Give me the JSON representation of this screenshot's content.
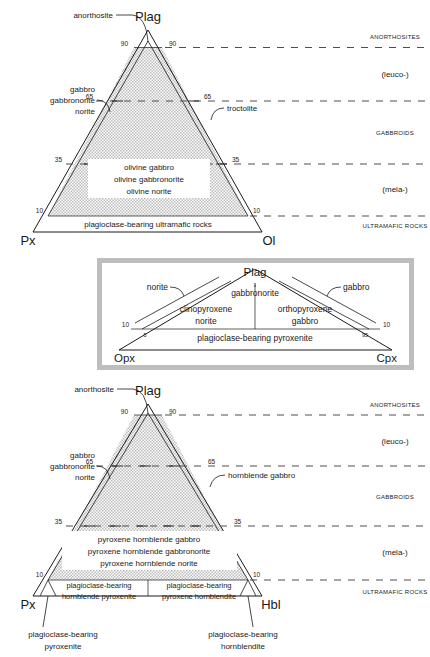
{
  "figure": {
    "kind": "ternary-classification-diagrams",
    "shade_color": "#d4d4d4",
    "dash_color": "#4e4e4e",
    "line_color": "#1a1a1a"
  },
  "top_diagram": {
    "name": "plag-px-ol-ternary",
    "apexes": {
      "top": "Plag",
      "left": "Px",
      "right": "Ol"
    },
    "ticks": {
      "left_90": "90",
      "right_90": "90",
      "left_65": "65",
      "right_65": "65",
      "left_35": "35",
      "right_35": "35",
      "left_10": "10",
      "right_10": "10"
    },
    "callouts": {
      "anorthosite": "anorthosite",
      "left_group_line1": "gabbro",
      "left_group_line2": "gabbronorite",
      "left_group_line3": "norite",
      "troctolite": "troctolite"
    },
    "center_box": {
      "line1": "olivine gabbro",
      "line2": "olivine gabbronorite",
      "line3": "olivine norite"
    },
    "base_band": "plagioclase-bearing ultramafic rocks",
    "side_categories": [
      "ANORTHOSITES",
      "(leuco-)",
      "GABBROIDS",
      "(mela-)",
      "ULTRAMAFIC ROCKS"
    ]
  },
  "inset_diagram": {
    "name": "plag-opx-cpx-ternary",
    "apexes": {
      "top": "Plag",
      "left": "Opx",
      "right": "Cpx"
    },
    "ticks": {
      "left_10": "10",
      "left_5": "5",
      "right_95": "95",
      "right_10": "10"
    },
    "callouts": {
      "norite": "norite",
      "gabbro": "gabbro",
      "gabbronorite": "gabbronorite"
    },
    "fields": {
      "left_line1": "clinopyroxene",
      "left_line2": "norite",
      "right_line1": "orthopyroxene",
      "right_line2": "gabbro"
    },
    "base_band": "plagioclase-bearing pyroxenite"
  },
  "bottom_diagram": {
    "name": "plag-px-hbl-ternary",
    "apexes": {
      "top": "Plag",
      "left": "Px",
      "right": "Hbl"
    },
    "ticks": {
      "left_90": "90",
      "right_90": "90",
      "left_65": "65",
      "right_65": "65",
      "left_35": "35",
      "right_35": "35",
      "left_10": "10",
      "right_10": "10"
    },
    "callouts": {
      "anorthosite": "anorthosite",
      "left_group_line1": "gabbro",
      "left_group_line2": "gabbronorite",
      "left_group_line3": "norite",
      "hornblende_gabbro": "hornblende gabbro"
    },
    "center_box": {
      "line1": "pyroxene hornblende gabbro",
      "line2": "pyroxene hornblende gabbronorite",
      "line3": "pyroxene hornblende norite"
    },
    "base_left": {
      "line1": "plagioclase-bearing",
      "line2": "hornblende pyroxenite"
    },
    "base_right": {
      "line1": "plagioclase-bearing",
      "line2": "pyroxene hornblendite"
    },
    "below_left": {
      "line1": "plagioclase-bearing",
      "line2": "pyroxenite"
    },
    "below_right": {
      "line1": "plagioclase-bearing",
      "line2": "hornblendite"
    },
    "side_categories": [
      "ANORTHOSITES",
      "(leuco-)",
      "GABBROIDS",
      "(mela-)",
      "ULTRAMAFIC ROCKS"
    ]
  }
}
